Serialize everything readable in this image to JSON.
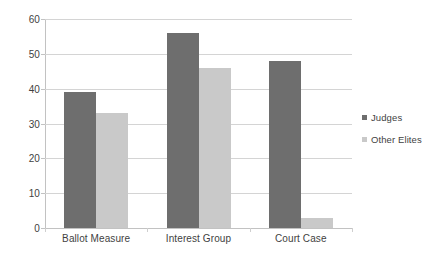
{
  "chart_data": {
    "type": "bar",
    "title": "",
    "xlabel": "",
    "ylabel": "",
    "categories": [
      "Ballot Measure",
      "Interest Group",
      "Court Case"
    ],
    "series": [
      {
        "name": "Judges",
        "color": "#6e6e6e",
        "values": [
          39,
          56,
          48
        ]
      },
      {
        "name": "Other Elites",
        "color": "#c9c9c9",
        "values": [
          33,
          46,
          3
        ]
      }
    ],
    "ylim": [
      0,
      60
    ],
    "yticks": [
      0,
      10,
      20,
      30,
      40,
      50,
      60
    ],
    "ytick_labels": [
      "0",
      "10",
      "20",
      "30",
      "40",
      "50",
      "60"
    ],
    "grid": true,
    "grid_axis": "y",
    "legend_position": "right",
    "background": "#ffffff",
    "gridline_color": "#d4d4d4",
    "axis_color": "#c2c2c2",
    "text_color": "#3f3f3f"
  },
  "legend": {
    "entries": [
      {
        "label": "Judges"
      },
      {
        "label": "Other Elites"
      }
    ]
  },
  "axes": {
    "y": {
      "ticks": [
        "60",
        "50",
        "40",
        "30",
        "20",
        "10",
        "0"
      ]
    },
    "x": {
      "labels": [
        "Ballot Measure",
        "Interest Group",
        "Court Case"
      ]
    }
  }
}
